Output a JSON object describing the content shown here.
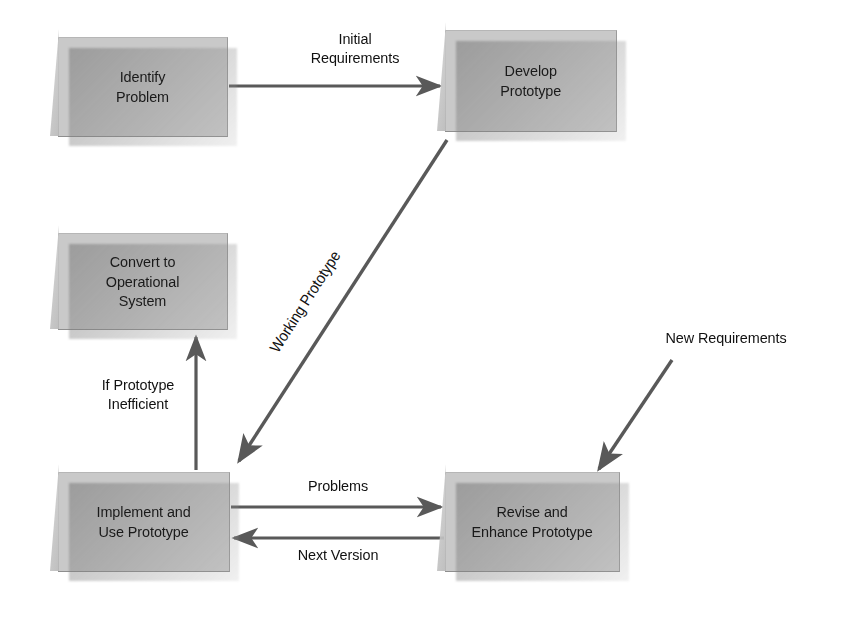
{
  "diagram": {
    "type": "flowchart",
    "background_color": "#ffffff",
    "box_fill_color": "#c9c9c9",
    "line_color": "#595959",
    "text_color": "#1a1a1a",
    "nodes": [
      {
        "id": "identify",
        "label": "Identify\nProblem",
        "x": 58,
        "y": 37,
        "w": 170,
        "h": 100
      },
      {
        "id": "develop",
        "label": "Develop\nPrototype",
        "x": 445,
        "y": 30,
        "w": 172,
        "h": 102
      },
      {
        "id": "convert",
        "label": "Convert to\nOperational\nSystem",
        "x": 58,
        "y": 233,
        "w": 170,
        "h": 97
      },
      {
        "id": "implement",
        "label": "Implement and\nUse Prototype",
        "x": 58,
        "y": 472,
        "w": 172,
        "h": 100
      },
      {
        "id": "revise",
        "label": "Revise and\nEnhance Prototype",
        "x": 445,
        "y": 472,
        "w": 175,
        "h": 100
      }
    ],
    "edges": [
      {
        "id": "initial-requirements",
        "label": "Initial\nRequirements",
        "from": "identify",
        "to": "develop",
        "label_x": 355,
        "label_y": 45,
        "rotated": false
      },
      {
        "id": "working-prototype",
        "label": "Working Prototype",
        "from": "develop",
        "to": "implement",
        "label_x": 305,
        "label_y": 300,
        "rotated": true
      },
      {
        "id": "if-prototype-inefficient",
        "label": "If Prototype\nInefficient",
        "from": "implement",
        "to": "convert",
        "label_x": 138,
        "label_y": 383,
        "rotated": false
      },
      {
        "id": "problems",
        "label": "Problems",
        "from": "implement",
        "to": "revise",
        "label_x": 338,
        "label_y": 483,
        "rotated": false
      },
      {
        "id": "next-version",
        "label": "Next Version",
        "from": "revise",
        "to": "implement",
        "label_x": 338,
        "label_y": 545,
        "rotated": false
      },
      {
        "id": "new-requirements",
        "label": "New Requirements",
        "from": "external",
        "to": "revise",
        "label_x": 724,
        "label_y": 335,
        "rotated": false
      }
    ]
  }
}
